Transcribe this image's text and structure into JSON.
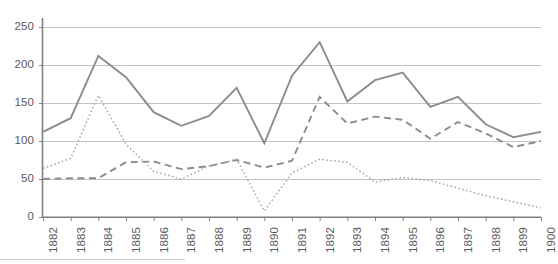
{
  "chart_data": {
    "type": "line",
    "title": "",
    "subtitle": "",
    "xlabel": "",
    "ylabel": "",
    "x": [
      "1882",
      "1883",
      "1884",
      "1885",
      "1886",
      "1887",
      "1888",
      "1889",
      "1890",
      "1891",
      "1892",
      "1893",
      "1894",
      "1895",
      "1896",
      "1897",
      "1898",
      "1899",
      "1900"
    ],
    "categories": [
      "1882",
      "1883",
      "1884",
      "1885",
      "1886",
      "1887",
      "1888",
      "1889",
      "1890",
      "1891",
      "1892",
      "1893",
      "1894",
      "1895",
      "1896",
      "1897",
      "1898",
      "1899",
      "1900"
    ],
    "xlim": [
      0,
      18
    ],
    "ylim": [
      0,
      250
    ],
    "y_ticks": [
      0,
      50,
      100,
      150,
      200,
      250
    ],
    "grid": true,
    "grid_axis": "y",
    "legend": false,
    "legend_position": "none",
    "series": [
      {
        "name": "series-solid",
        "style": "solid",
        "color": "#8c8c8c",
        "values": [
          112,
          130,
          212,
          184,
          138,
          120,
          133,
          170,
          97,
          186,
          230,
          152,
          180,
          190,
          145,
          158,
          122,
          105,
          112
        ]
      },
      {
        "name": "series-dashed",
        "style": "dashed",
        "color": "#8c8c8c",
        "values": [
          50,
          51,
          51,
          72,
          73,
          63,
          67,
          75,
          65,
          74,
          158,
          123,
          132,
          128,
          103,
          125,
          110,
          92,
          100
        ]
      },
      {
        "name": "series-dotted",
        "style": "dotted",
        "color": "#a8a8a8",
        "values": [
          64,
          77,
          160,
          96,
          60,
          50,
          67,
          76,
          8,
          58,
          76,
          72,
          46,
          52,
          48,
          38,
          28,
          20,
          12
        ]
      }
    ]
  },
  "axes": {
    "y_tick_labels": [
      "250",
      "200",
      "150",
      "100",
      "50",
      "0"
    ],
    "x_tick_labels": [
      "1882",
      "1883",
      "1884",
      "1885",
      "1886",
      "1887",
      "1888",
      "1889",
      "1890",
      "1891",
      "1892",
      "1893",
      "1894",
      "1895",
      "1896",
      "1897",
      "1898",
      "1899",
      "1900"
    ]
  },
  "colors": {
    "axis": "#808080",
    "grid": "#c4c4c4",
    "solid_line": "#8c8c8c",
    "dashed_line": "#8c8c8c",
    "dotted_line": "#a8a8a8",
    "tick_text": "#58595b",
    "background": "#ffffff"
  }
}
